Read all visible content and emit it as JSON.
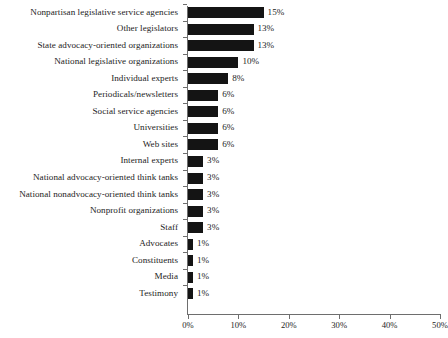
{
  "chart_data": {
    "type": "bar",
    "orientation": "horizontal",
    "title": "",
    "subtitle": "",
    "xlabel": "",
    "ylabel": "",
    "xlim": [
      0,
      50
    ],
    "xticks": [
      0,
      10,
      20,
      30,
      40,
      50
    ],
    "xtick_labels": [
      "0%",
      "10%",
      "20%",
      "30%",
      "40%",
      "50%"
    ],
    "grid": false,
    "legend": null,
    "bar_color": "#141414",
    "axis_color": "#6e6e6e",
    "value_label_suffix": "%",
    "categories": [
      "Nonpartisan legislative service agencies",
      "Other legislators",
      "State advocacy-oriented organizations",
      "National legislative organizations",
      "Individual experts",
      "Periodicals/newsletters",
      "Social service agencies",
      "Universities",
      "Web sites",
      "Internal experts",
      "National advocacy-oriented think tanks",
      "National nonadvocacy-oriented think tanks",
      "Nonprofit organizations",
      "Staff",
      "Advocates",
      "Constituents",
      "Media",
      "Testimony"
    ],
    "values": [
      15,
      13,
      13,
      10,
      8,
      6,
      6,
      6,
      6,
      3,
      3,
      3,
      3,
      3,
      1,
      1,
      1,
      1
    ],
    "value_labels": [
      "15%",
      "13%",
      "13%",
      "10%",
      "8%",
      "6%",
      "6%",
      "6%",
      "6%",
      "3%",
      "3%",
      "3%",
      "3%",
      "3%",
      "1%",
      "1%",
      "1%",
      "1%"
    ]
  }
}
